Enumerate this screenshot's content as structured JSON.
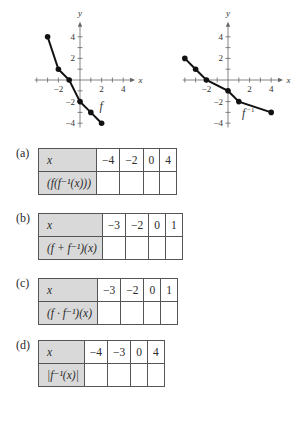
{
  "graphs": [
    {
      "name": "f",
      "label": "f",
      "axis_x_label": "x",
      "axis_y_label": "y",
      "x_ticks": [
        "-2",
        "2",
        "4"
      ],
      "y_ticks": [
        "4",
        "2",
        "-2",
        "-4"
      ],
      "points": [
        [
          -3,
          4
        ],
        [
          -2,
          1
        ],
        [
          -1,
          0
        ],
        [
          0,
          -2
        ],
        [
          1,
          -3
        ],
        [
          2,
          -4
        ]
      ]
    },
    {
      "name": "f_inverse",
      "label": "f⁻¹",
      "axis_x_label": "x",
      "axis_y_label": "y",
      "x_ticks": [
        "-2",
        "2",
        "4"
      ],
      "y_ticks": [
        "4",
        "2",
        "-2",
        "-4"
      ],
      "points": [
        [
          -4,
          2
        ],
        [
          -3,
          1
        ],
        [
          -2,
          0
        ],
        [
          0,
          -1
        ],
        [
          1,
          -2
        ],
        [
          4,
          -3
        ]
      ]
    }
  ],
  "parts": [
    {
      "label": "(a)",
      "row1_header": "x",
      "row2_header": "(f(f⁻¹(x)))",
      "x_values": [
        "−4",
        "−2",
        "0",
        "4"
      ]
    },
    {
      "label": "(b)",
      "row1_header": "x",
      "row2_header": "(f + f⁻¹)(x)",
      "x_values": [
        "−3",
        "−2",
        "0",
        "1"
      ]
    },
    {
      "label": "(c)",
      "row1_header": "x",
      "row2_header": "(f · f⁻¹)(x)",
      "x_values": [
        "−3",
        "−2",
        "0",
        "1"
      ]
    },
    {
      "label": "(d)",
      "row1_header": "x",
      "row2_header": "|f⁻¹(x)|",
      "x_values": [
        "−4",
        "−3",
        "0",
        "4"
      ]
    }
  ],
  "chart_data": [
    {
      "type": "line",
      "title": "f",
      "xlabel": "x",
      "ylabel": "y",
      "x": [
        -3,
        -2,
        -1,
        0,
        1,
        2
      ],
      "values": [
        4,
        1,
        0,
        -2,
        -3,
        -4
      ],
      "xlim": [
        -4,
        5
      ],
      "ylim": [
        -4.5,
        5
      ],
      "grid": false
    },
    {
      "type": "line",
      "title": "f⁻¹",
      "xlabel": "x",
      "ylabel": "y",
      "x": [
        -4,
        -3,
        -2,
        0,
        1,
        4
      ],
      "values": [
        2,
        1,
        0,
        -1,
        -2,
        -3
      ],
      "xlim": [
        -4,
        5
      ],
      "ylim": [
        -4.5,
        5
      ],
      "grid": false
    }
  ]
}
